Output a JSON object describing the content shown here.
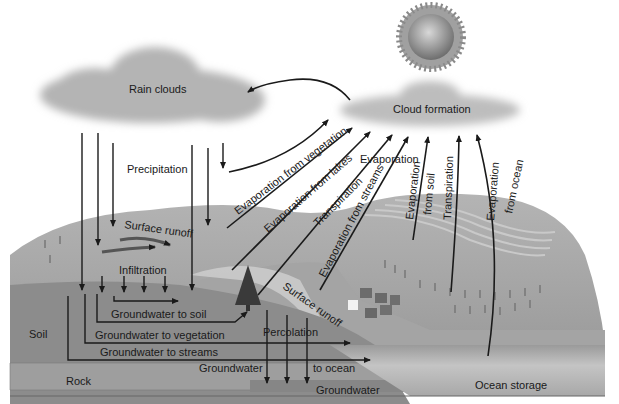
{
  "diagram": {
    "colors": {
      "background": "#ffffff",
      "cloud": "#b9b9b9",
      "hill": "#a8a8a8",
      "soil": "#8e8e8e",
      "rock": "#9a9a9a",
      "ocean": "#b5b5b5",
      "arrow": "#1a1a1a",
      "sun": "#9a9a9a"
    },
    "labels": {
      "rain_clouds": "Rain clouds",
      "cloud_formation": "Cloud formation",
      "precipitation": "Precipitation",
      "evaporation_from_vegetation": "Evaporation from vegetation",
      "evaporation_from_lakes": "Evaporation from lakes",
      "transpiration_left": "Transpiration",
      "evaporation_from_streams": "Evaporation from streams",
      "evaporation": "Evaporation",
      "evaporation_from_soil_1": "Evaporation",
      "evaporation_from_soil_2": "from soil",
      "transpiration_right": "Transpiration",
      "evaporation_from_ocean_1": "Evaporation",
      "evaporation_from_ocean_2": "from ocean",
      "surface_runoff_upper": "Surface runoff",
      "surface_runoff_lower": "Surface runoff",
      "infiltration": "Infiltration",
      "groundwater_to_soil": "Groundwater to soil",
      "soil": "Soil",
      "groundwater_to_vegetation": "Groundwater to vegetation",
      "groundwater_to_streams": "Groundwater to streams",
      "percolation": "Percolation",
      "groundwater": "Groundwater",
      "to_ocean": "to ocean",
      "rock": "Rock",
      "groundwater_bottom": "Groundwater",
      "ocean_storage": "Ocean storage"
    },
    "icons": [
      "sun-icon",
      "rain-cloud-icon",
      "formation-cloud-icon",
      "pine-tree-icon",
      "village-houses-icon"
    ]
  }
}
